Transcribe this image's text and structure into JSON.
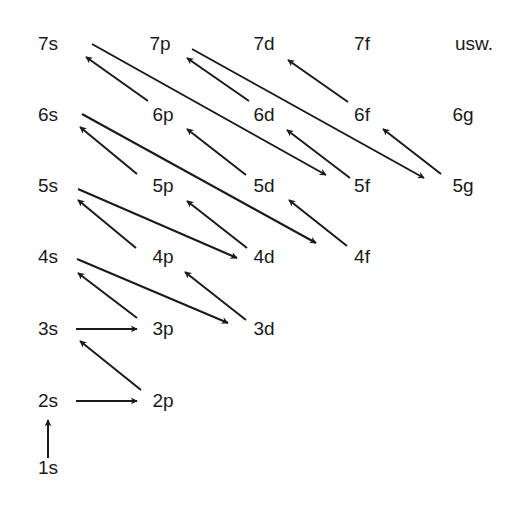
{
  "diagram": {
    "type": "aufbau-principle-orbital-filling-order",
    "colors": {
      "ink": "#1a1a1a",
      "background": "#ffffff"
    },
    "orbitals": [
      {
        "id": "7s",
        "label": "7s",
        "x": 48,
        "y": 43
      },
      {
        "id": "7p",
        "label": "7p",
        "x": 160,
        "y": 43
      },
      {
        "id": "7d",
        "label": "7d",
        "x": 264,
        "y": 43
      },
      {
        "id": "7f",
        "label": "7f",
        "x": 362,
        "y": 43
      },
      {
        "id": "usw",
        "label": "usw.",
        "x": 474,
        "y": 43
      },
      {
        "id": "6s",
        "label": "6s",
        "x": 48,
        "y": 114
      },
      {
        "id": "6p",
        "label": "6p",
        "x": 163,
        "y": 114
      },
      {
        "id": "6d",
        "label": "6d",
        "x": 264,
        "y": 114
      },
      {
        "id": "6f",
        "label": "6f",
        "x": 362,
        "y": 114
      },
      {
        "id": "6g",
        "label": "6g",
        "x": 463,
        "y": 114
      },
      {
        "id": "5s",
        "label": "5s",
        "x": 48,
        "y": 185
      },
      {
        "id": "5p",
        "label": "5p",
        "x": 163,
        "y": 185
      },
      {
        "id": "5d",
        "label": "5d",
        "x": 264,
        "y": 185
      },
      {
        "id": "5f",
        "label": "5f",
        "x": 362,
        "y": 185
      },
      {
        "id": "5g",
        "label": "5g",
        "x": 463,
        "y": 185
      },
      {
        "id": "4s",
        "label": "4s",
        "x": 48,
        "y": 256
      },
      {
        "id": "4p",
        "label": "4p",
        "x": 163,
        "y": 256
      },
      {
        "id": "4d",
        "label": "4d",
        "x": 264,
        "y": 256
      },
      {
        "id": "4f",
        "label": "4f",
        "x": 362,
        "y": 256
      },
      {
        "id": "3s",
        "label": "3s",
        "x": 48,
        "y": 328
      },
      {
        "id": "3p",
        "label": "3p",
        "x": 163,
        "y": 328
      },
      {
        "id": "3d",
        "label": "3d",
        "x": 264,
        "y": 328
      },
      {
        "id": "2s",
        "label": "2s",
        "x": 48,
        "y": 400
      },
      {
        "id": "2p",
        "label": "2p",
        "x": 163,
        "y": 400
      },
      {
        "id": "1s",
        "label": "1s",
        "x": 48,
        "y": 467
      }
    ],
    "arrows": [
      {
        "from": "1s",
        "to": "2s",
        "x1": 48,
        "y1": 458,
        "x2": 48,
        "y2": 420
      },
      {
        "from": "2s",
        "to": "2p",
        "x1": 76,
        "y1": 401,
        "x2": 137,
        "y2": 401
      },
      {
        "from": "2p",
        "to": "3s",
        "x1": 141,
        "y1": 390,
        "x2": 80,
        "y2": 341
      },
      {
        "from": "3s",
        "to": "3p",
        "x1": 76,
        "y1": 329,
        "x2": 137,
        "y2": 329
      },
      {
        "from": "3p",
        "to": "4s",
        "x1": 137,
        "y1": 318,
        "x2": 78,
        "y2": 273
      },
      {
        "from": "4s",
        "to": "3d",
        "x1": 77,
        "y1": 259,
        "x2": 228,
        "y2": 323
      },
      {
        "from": "3d",
        "to": "4p",
        "x1": 246,
        "y1": 320,
        "x2": 185,
        "y2": 272
      },
      {
        "from": "4p",
        "to": "5s",
        "x1": 136,
        "y1": 248,
        "x2": 78,
        "y2": 200
      },
      {
        "from": "5s",
        "to": "4d",
        "x1": 78,
        "y1": 189,
        "x2": 237,
        "y2": 258
      },
      {
        "from": "4d",
        "to": "5p",
        "x1": 247,
        "y1": 248,
        "x2": 187,
        "y2": 201
      },
      {
        "from": "5p",
        "to": "6s",
        "x1": 137,
        "y1": 174,
        "x2": 80,
        "y2": 127
      },
      {
        "from": "6s",
        "to": "4f",
        "x1": 82,
        "y1": 114,
        "x2": 316,
        "y2": 243
      },
      {
        "from": "4f",
        "to": "5d",
        "x1": 347,
        "y1": 246,
        "x2": 289,
        "y2": 200
      },
      {
        "from": "5d",
        "to": "6p",
        "x1": 246,
        "y1": 175,
        "x2": 187,
        "y2": 129
      },
      {
        "from": "6p",
        "to": "7s",
        "x1": 148,
        "y1": 101,
        "x2": 86,
        "y2": 57
      },
      {
        "from": "7s",
        "to": "5f",
        "x1": 92,
        "y1": 44,
        "x2": 326,
        "y2": 175
      },
      {
        "from": "5f",
        "to": "6d",
        "x1": 350,
        "y1": 178,
        "x2": 287,
        "y2": 130
      },
      {
        "from": "6d",
        "to": "7p",
        "x1": 249,
        "y1": 101,
        "x2": 187,
        "y2": 58
      },
      {
        "from": "7p",
        "to": "5g",
        "x1": 192,
        "y1": 49,
        "x2": 424,
        "y2": 178
      },
      {
        "from": "5g",
        "to": "6f",
        "x1": 441,
        "y1": 174,
        "x2": 383,
        "y2": 129
      },
      {
        "from": "6f",
        "to": "7d",
        "x1": 348,
        "y1": 102,
        "x2": 288,
        "y2": 60
      }
    ]
  }
}
